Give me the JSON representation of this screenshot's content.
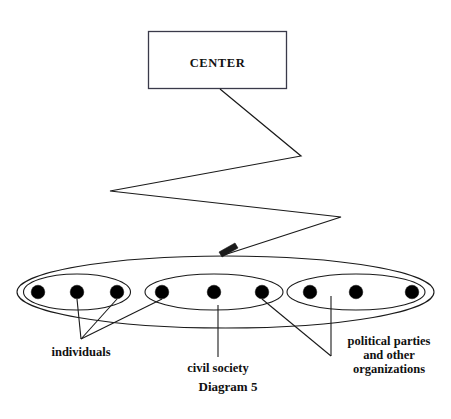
{
  "figure": {
    "caption": "Diagram 5",
    "center_box": {
      "label": "CENTER"
    },
    "annotations": {
      "individuals": "individuals",
      "civil_society": "civil society",
      "organizations_line1": "political parties",
      "organizations_line2": "and other",
      "organizations_line3": "organizations"
    },
    "colors": {
      "stroke": "#1a1a1a",
      "dot_fill": "#000000",
      "box_stroke": "#3a3a4a",
      "background": "#ffffff",
      "text": "#111111"
    },
    "groups": [
      {
        "name": "individuals-group",
        "dot_count": 3,
        "label": "individuals"
      },
      {
        "name": "civil-society-group",
        "dot_count": 3,
        "label": "civil society"
      },
      {
        "name": "organizations-group",
        "dot_count": 3,
        "label": "political parties and other organizations"
      }
    ],
    "outer_container": {
      "name": "society-outer-ellipse",
      "dot_count": 9,
      "group_count": 3
    },
    "connector": {
      "name": "center-to-society-zigzag",
      "segments": 4,
      "arrow_target": "society-outer-ellipse"
    }
  }
}
